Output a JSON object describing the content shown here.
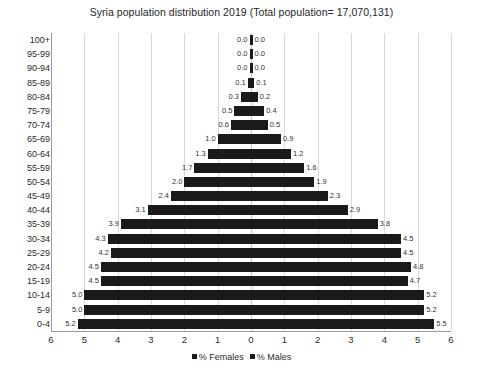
{
  "chart_data": {
    "type": "bar",
    "subtype": "population-pyramid",
    "title": "Syria population distribution 2019 (Total population= 17,070,131)",
    "xlabel": "",
    "ylabel": "",
    "xlim": [
      -6,
      6
    ],
    "xticks": [
      "6",
      "5",
      "4",
      "3",
      "2",
      "1",
      "0",
      "1",
      "2",
      "3",
      "4",
      "5",
      "6"
    ],
    "xtick_values": [
      -6,
      -5,
      -4,
      -3,
      -2,
      -1,
      0,
      1,
      2,
      3,
      4,
      5,
      6
    ],
    "grid": true,
    "grid_axis": "x",
    "legend_position": "bottom",
    "categories": [
      "100+",
      "95-99",
      "90-94",
      "85-89",
      "80-84",
      "75-79",
      "70-74",
      "65-69",
      "60-64",
      "55-59",
      "50-54",
      "45-49",
      "40-44",
      "35-39",
      "30-34",
      "25-29",
      "20-24",
      "15-19",
      "10-14",
      "5-9",
      "0-4"
    ],
    "series": [
      {
        "name": "% Females",
        "side": "left",
        "color": "#1a1a1a",
        "values": [
          0.0,
          0.0,
          0.0,
          0.1,
          0.3,
          0.5,
          0.6,
          1.0,
          1.3,
          1.7,
          2.0,
          2.4,
          3.1,
          3.9,
          4.3,
          4.2,
          4.5,
          4.5,
          5.0,
          5.0,
          5.2
        ],
        "labels": [
          "0.0",
          "0.0",
          "0.0",
          "0.1",
          "0.3",
          "0.5",
          "0.6",
          "1.0",
          "1.3",
          "1.7",
          "2.0",
          "2.4",
          "3.1",
          "3.9",
          "4.3",
          "4.2",
          "4.5",
          "4.5",
          "5.0",
          "5.0",
          "5.2"
        ]
      },
      {
        "name": "% Males",
        "side": "right",
        "color": "#1a1a1a",
        "values": [
          0.0,
          0.0,
          0.0,
          0.1,
          0.2,
          0.4,
          0.5,
          0.9,
          1.2,
          1.6,
          1.9,
          2.3,
          2.9,
          3.8,
          4.5,
          4.5,
          4.8,
          4.7,
          5.2,
          5.2,
          5.5
        ],
        "labels": [
          "0.0",
          "0.0",
          "0.0",
          "0.1",
          "0.2",
          "0.4",
          "0.5",
          "0.9",
          "1.2",
          "1.6",
          "1.9",
          "2.3",
          "2.9",
          "3.8",
          "4.5",
          "4.5",
          "4.8",
          "4.7",
          "5.2",
          "5.2",
          "5.5"
        ]
      }
    ]
  },
  "legend": {
    "items": [
      {
        "label": "% Females",
        "color": "#1a1a1a"
      },
      {
        "label": "% Males",
        "color": "#1a1a1a"
      }
    ]
  },
  "style": {
    "background": "#ffffff",
    "gridline_color": "#d9d9d9",
    "axis_color": "#9a9a9a",
    "text_color": "#2b2b2b",
    "bar_color": "#1a1a1a"
  }
}
